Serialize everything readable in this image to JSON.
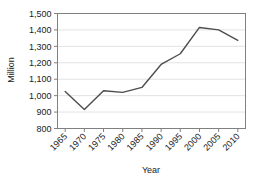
{
  "chart_data": {
    "type": "line",
    "title": "",
    "xlabel": "Year",
    "ylabel": "Million",
    "x": [
      1965,
      1970,
      1975,
      1980,
      1985,
      1990,
      1995,
      2000,
      2005,
      2010
    ],
    "values": [
      1025,
      915,
      1030,
      1020,
      1050,
      1190,
      1255,
      1415,
      1400,
      1337
    ],
    "xtick_labels": [
      "1965",
      "1970",
      "1975",
      "1980",
      "1985",
      "1990",
      "1995",
      "2000",
      "2005",
      "2010"
    ],
    "ytick_labels": [
      "800",
      "900",
      "1,000",
      "1,100",
      "1,200",
      "1,300",
      "1,400",
      "1,500"
    ],
    "ytick_values": [
      800,
      900,
      1000,
      1100,
      1200,
      1300,
      1400,
      1500
    ],
    "xlim": [
      1963,
      2012
    ],
    "ylim": [
      800,
      1500
    ],
    "grid": true,
    "legend": false,
    "series_color": "#4d4d4d",
    "grid_color": "#e2e2e2",
    "frame_color": "#808080",
    "text_color": "#222222",
    "xtick_rotation": 45
  }
}
